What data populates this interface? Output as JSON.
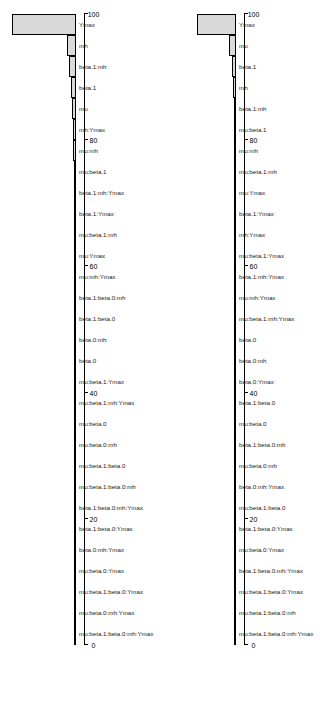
{
  "figure": {
    "type": "two-panel-horizontal-bar",
    "panel_count": 2
  },
  "chart_data": [
    {
      "type": "bar",
      "panel": "left",
      "title": "",
      "xlabel": "",
      "ylabel": "",
      "orientation": "horizontal",
      "axis_ticks": [
        "0",
        "20",
        "40",
        "60",
        "80",
        "100"
      ],
      "xlim": [
        0,
        100
      ],
      "grid": false,
      "legend": "none",
      "categories": [
        "mu:beta.1:beta.0:mh:Ymax",
        "mu:beta.0:mh:Ymax",
        "mu:beta.1:beta.0:Ymax",
        "mu:beta.0:Ymax",
        "beta.0:mh:Ymax",
        "beta.1:beta.0:Ymax",
        "beta.1:beta.0:mh:Ymax",
        "mu:beta.1:beta.0:mh",
        "mu:beta.1:beta.0",
        "mu:beta.0:mh",
        "mu:beta.0",
        "mu:beta.1:mh:Ymax",
        "mu:beta.1:Ymax",
        "beta.0",
        "beta.0:mh",
        "beta.1:beta.0",
        "beta.1:beta.0:mh",
        "mu:mh:Ymax",
        "mu:Ymax",
        "mu:beta.1:mh",
        "beta.1:Ymax",
        "beta.1:mh:Ymax",
        "mu:beta.1",
        "mu:mh",
        "mh:Ymax",
        "mu",
        "beta.1",
        "beta.1:mh",
        "mh",
        "Ymax"
      ],
      "values": [
        0.2,
        0.2,
        0.2,
        0.2,
        0.2,
        0.2,
        0.2,
        0.2,
        0.2,
        0.2,
        0.2,
        0.2,
        0.2,
        0.3,
        0.3,
        0.3,
        0.4,
        0.5,
        0.6,
        0.8,
        1.0,
        1.3,
        1.8,
        2.4,
        3.2,
        4.2,
        6.0,
        8.5,
        12.0,
        92.0
      ]
    },
    {
      "type": "bar",
      "panel": "right",
      "title": "",
      "xlabel": "",
      "ylabel": "",
      "orientation": "horizontal",
      "axis_ticks": [
        "0",
        "20",
        "40",
        "60",
        "80",
        "100"
      ],
      "xlim": [
        0,
        100
      ],
      "grid": false,
      "legend": "none",
      "categories": [
        "mu:beta.1:beta.0:mh:Ymax",
        "mu:beta.1:beta.0:mh",
        "mu:beta.1:beta.0:Ymax",
        "beta.1:beta.0:mh:Ymax",
        "mu:beta.0:Ymax",
        "beta.1:beta.0:Ymax",
        "mu:beta.1:beta.0",
        "beta.0:mh:Ymax",
        "mu:beta.0:mh",
        "beta.1:beta.0:mh",
        "mu:beta.0",
        "beta.1:beta.0",
        "beta.0:Ymax",
        "beta.0:mh",
        "beta.0",
        "mu:beta.1:mh:Ymax",
        "mu:mh:Ymax",
        "beta.1:mh:Ymax",
        "mu:beta.1:Ymax",
        "mh:Ymax",
        "beta.1:Ymax",
        "mu:Ymax",
        "mu:beta.1:mh",
        "mu:mh",
        "mu:beta.1",
        "beta.1:mh",
        "mh",
        "beta.1",
        "mu",
        "Ymax"
      ],
      "values": [
        0.2,
        0.2,
        0.2,
        0.2,
        0.2,
        0.2,
        0.2,
        0.2,
        0.2,
        0.2,
        0.2,
        0.2,
        0.2,
        0.2,
        0.3,
        0.3,
        0.3,
        0.3,
        0.4,
        0.4,
        0.5,
        0.6,
        0.8,
        1.0,
        1.4,
        2.0,
        3.0,
        5.0,
        8.0,
        55.0
      ]
    }
  ]
}
